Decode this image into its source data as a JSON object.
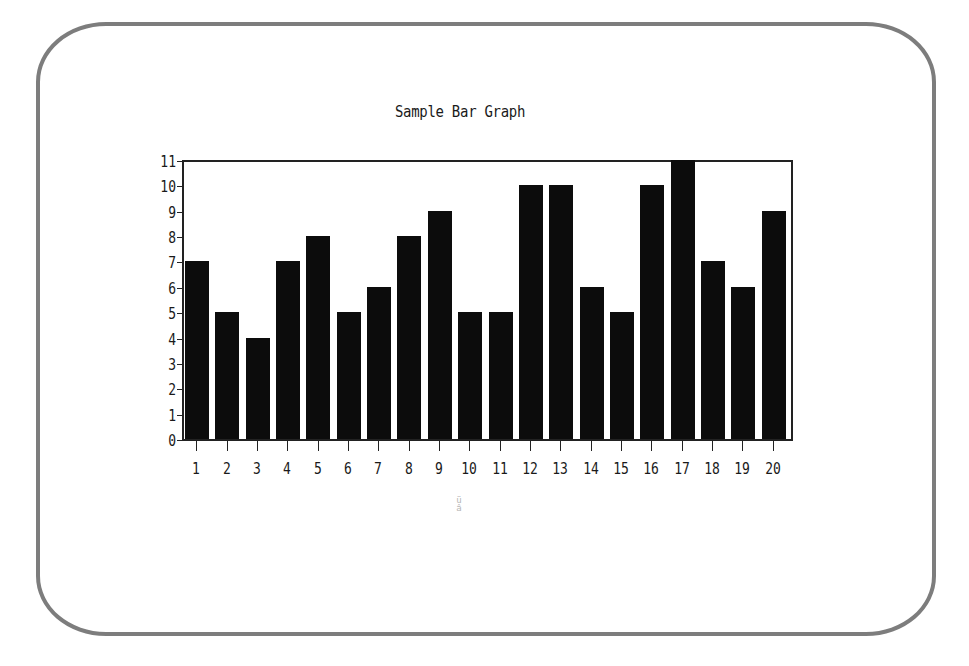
{
  "chart_data": {
    "type": "bar",
    "title": "Sample Bar Graph",
    "xlabel": "",
    "ylabel": "",
    "categories": [
      "1",
      "2",
      "3",
      "4",
      "5",
      "6",
      "7",
      "8",
      "9",
      "10",
      "11",
      "12",
      "13",
      "14",
      "15",
      "16",
      "17",
      "18",
      "19",
      "20"
    ],
    "values": [
      7,
      5,
      4,
      7,
      8,
      5,
      6,
      8,
      9,
      5,
      5,
      10,
      10,
      6,
      5,
      10,
      11,
      7,
      6,
      9
    ],
    "ylim": [
      0,
      11
    ],
    "y_ticks": [
      "0",
      "1",
      "2",
      "3",
      "4",
      "5",
      "6",
      "7",
      "8",
      "9",
      "10",
      "11"
    ],
    "grid": false,
    "legend": null,
    "bar_color": "#0c0c0c"
  },
  "screen": {
    "frame_color": "#7d7d7d",
    "stray_mark": "ü\nâ"
  }
}
